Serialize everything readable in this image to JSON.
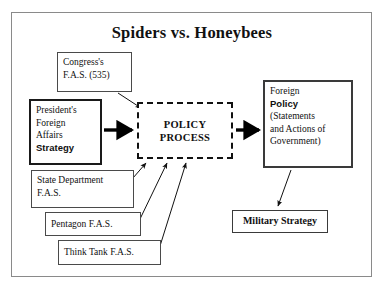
{
  "diagram": {
    "title": "Spiders vs. Honeybees",
    "nodes": {
      "congress": {
        "line1": "Congress's",
        "line2": "F.A.S. (535)"
      },
      "president": {
        "line1": "President's",
        "line2": "Foreign",
        "line3": "Affairs",
        "line4": "Strategy"
      },
      "policy_process": {
        "line1": "POLICY",
        "line2": "PROCESS"
      },
      "foreign_policy": {
        "line1": "Foreign",
        "line2": "Policy",
        "line3": "(Statements",
        "line4": "and Actions of",
        "line5": "Government)"
      },
      "state_department": {
        "line1": "State Department",
        "line2": "F.A.S."
      },
      "pentagon": {
        "label": "Pentagon F.A.S."
      },
      "think_tank": {
        "label": "Think Tank F.A.S."
      },
      "military_strategy": {
        "label": "Military Strategy"
      }
    },
    "edges": [
      {
        "name": "congress-to-policy-process",
        "style": "thin-arrow"
      },
      {
        "name": "president-to-policy-process",
        "style": "thick-arrow"
      },
      {
        "name": "policy-process-to-foreign-policy",
        "style": "thick-arrow"
      },
      {
        "name": "state-department-to-policy-process",
        "style": "thin-arrow"
      },
      {
        "name": "pentagon-to-policy-process",
        "style": "thin-arrow"
      },
      {
        "name": "think-tank-to-policy-process",
        "style": "thin-arrow"
      },
      {
        "name": "foreign-policy-to-military-strategy",
        "style": "thin-arrow"
      }
    ],
    "colors": {
      "ink": "#111111",
      "box_border": "#4a4a4a",
      "frame_border": "#8a8a8a",
      "background": "#ffffff"
    }
  }
}
